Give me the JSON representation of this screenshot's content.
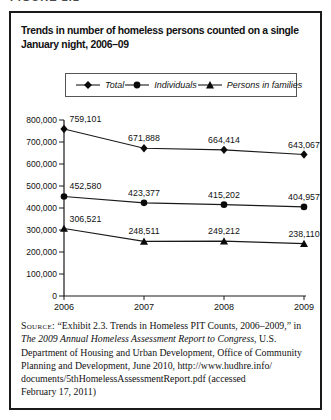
{
  "figure_label": "FIGURE 1.1",
  "title_lines": {
    "line1": "Trends in number of homeless persons counted on a single",
    "line2": "January night, 2006–09"
  },
  "legend": {
    "items": [
      {
        "label": "Total",
        "marker": "diamond"
      },
      {
        "label": "Individuals",
        "marker": "circle"
      },
      {
        "label": "Persons in families",
        "marker": "triangle"
      }
    ]
  },
  "chart_data": {
    "type": "line",
    "title": "Trends in number of homeless persons counted on a single January night, 2006–09",
    "x": [
      2006,
      2007,
      2008,
      2009
    ],
    "x_labels": [
      "2006",
      "2007",
      "2008",
      "2009"
    ],
    "series": [
      {
        "name": "Total",
        "marker": "diamond",
        "values": [
          759101,
          671888,
          664414,
          643067
        ],
        "value_labels": [
          "759,101",
          "671,888",
          "664,414",
          "643,067"
        ]
      },
      {
        "name": "Individuals",
        "marker": "circle",
        "values": [
          452580,
          423377,
          415202,
          404957
        ],
        "value_labels": [
          "452,580",
          "423,377",
          "415,202",
          "404,957"
        ]
      },
      {
        "name": "Persons in families",
        "marker": "triangle",
        "values": [
          306521,
          248511,
          249212,
          238110
        ],
        "value_labels": [
          "306,521",
          "248,511",
          "249,212",
          "238,110"
        ]
      }
    ],
    "ylim": [
      0,
      800000
    ],
    "ytick_interval": 100000,
    "ytick_labels": [
      "0",
      "100,000",
      "200,000",
      "300,000",
      "400,000",
      "500,000",
      "600,000",
      "700,000",
      "800,000"
    ],
    "grid": false,
    "legend_position": "top",
    "line_color": "#1a1a1a",
    "xlabel": "",
    "ylabel": ""
  },
  "source": {
    "lines": [
      [
        {
          "style": "sc",
          "text": "Source:"
        },
        {
          "style": "n",
          "text": " “Exhibit 2.3. Trends in Homeless PIT Counts, 2006–2009,” in"
        }
      ],
      [
        {
          "style": "it",
          "text": "The 2009 Annual Homeless Assessment Report to Congress"
        },
        {
          "style": "n",
          "text": ", U.S."
        }
      ],
      [
        {
          "style": "n",
          "text": "Department of Housing and Urban Development, Office of Community"
        }
      ],
      [
        {
          "style": "n",
          "text": "Planning and Development, June 2010, http://www.hudhre.info/"
        }
      ],
      [
        {
          "style": "n",
          "text": "documents/5thHomelessAssessmentReport.pdf (accessed"
        }
      ],
      [
        {
          "style": "n",
          "text": "February 17, 2011)"
        }
      ]
    ]
  }
}
